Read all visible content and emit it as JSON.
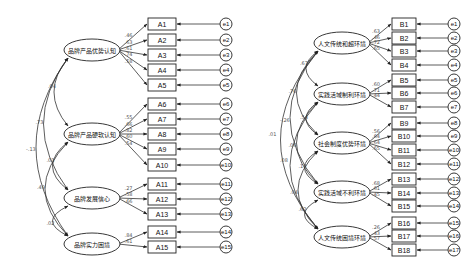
{
  "left_model": {
    "latents": [
      {
        "id": "LA1",
        "label": "品牌产品优势认知",
        "cx": 92,
        "cy": 50,
        "indicators": [
          0,
          1,
          2,
          3,
          4
        ]
      },
      {
        "id": "LA2",
        "label": "品牌产品硬软认知",
        "cx": 92,
        "cy": 134,
        "indicators": [
          5,
          6,
          7,
          8,
          9
        ]
      },
      {
        "id": "LA3",
        "label": "品牌发展信心",
        "cx": 92,
        "cy": 198,
        "indicators": [
          10,
          11,
          12
        ]
      },
      {
        "id": "LA4",
        "label": "品牌实力困境",
        "cx": 92,
        "cy": 244,
        "indicators": [
          13,
          14
        ]
      }
    ],
    "indicators": [
      {
        "label": "A1",
        "y": 24,
        "loading": ".46",
        "error": "e1"
      },
      {
        "label": "A2",
        "y": 40,
        "loading": ".63",
        "error": "e2"
      },
      {
        "label": "A3",
        "y": 55,
        "loading": ".61",
        "error": "e3"
      },
      {
        "label": "A4",
        "y": 70,
        "loading": ".74",
        "error": "e4"
      },
      {
        "label": "A5",
        "y": 85,
        "loading": ".58",
        "error": "e5"
      },
      {
        "label": "A6",
        "y": 104,
        "loading": ".55",
        "error": "e6"
      },
      {
        "label": "A7",
        "y": 119,
        "loading": ".66",
        "error": "e7"
      },
      {
        "label": "A8",
        "y": 134,
        "loading": ".82",
        "error": "e8"
      },
      {
        "label": "A9",
        "y": 149,
        "loading": ".60",
        "error": "e9"
      },
      {
        "label": "A10",
        "y": 165,
        "loading": ".54",
        "error": "e10"
      },
      {
        "label": "A11",
        "y": 184,
        "loading": ".27",
        "error": "e11"
      },
      {
        "label": "A12",
        "y": 199,
        "loading": ".58",
        "error": "e12"
      },
      {
        "label": "A13",
        "y": 214,
        "loading": ".66",
        "error": "e13"
      },
      {
        "label": "A14",
        "y": 232,
        "loading": ".84",
        "error": "e14"
      },
      {
        "label": "A15",
        "y": 247,
        "loading": ".61",
        "error": "e15"
      }
    ],
    "covariances": [
      {
        "from": 0,
        "to": 1,
        "value": ".04"
      },
      {
        "from": 0,
        "to": 2,
        "value": ".73"
      },
      {
        "from": 0,
        "to": 3,
        "value": "-.13"
      },
      {
        "from": 1,
        "to": 2,
        "value": ".03"
      },
      {
        "from": 1,
        "to": 3,
        "value": ".49"
      },
      {
        "from": 2,
        "to": 3,
        "value": ".02"
      }
    ]
  },
  "right_model": {
    "latents": [
      {
        "id": "LB1",
        "label": "人文传统和超环境",
        "cx": 342,
        "cy": 43,
        "indicators": [
          0,
          1,
          2,
          3
        ]
      },
      {
        "id": "LB2",
        "label": "实践活域制利环境",
        "cx": 342,
        "cy": 94,
        "indicators": [
          4,
          5,
          6
        ]
      },
      {
        "id": "LB3",
        "label": "社会制度优势环境",
        "cx": 342,
        "cy": 143,
        "indicators": [
          7,
          8,
          9,
          10
        ]
      },
      {
        "id": "LB4",
        "label": "实践活域不利环境",
        "cx": 342,
        "cy": 192,
        "indicators": [
          11,
          12,
          13
        ]
      },
      {
        "id": "LB5",
        "label": "人文传统困境环境",
        "cx": 342,
        "cy": 237,
        "indicators": [
          14,
          15,
          16
        ]
      }
    ],
    "indicators": [
      {
        "label": "B1",
        "y": 24,
        "loading": ".63",
        "error": "e1"
      },
      {
        "label": "B2",
        "y": 38,
        "loading": ".46",
        "error": "e2"
      },
      {
        "label": "B3",
        "y": 51,
        "loading": ".72",
        "error": "e3"
      },
      {
        "label": "B4",
        "y": 65,
        "loading": ".65",
        "error": "e4"
      },
      {
        "label": "B5",
        "y": 80,
        "loading": ".60",
        "error": "e5"
      },
      {
        "label": "B6",
        "y": 93,
        "loading": ".71",
        "error": "e6"
      },
      {
        "label": "B7",
        "y": 107,
        "loading": ".44",
        "error": "e7"
      },
      {
        "label": "B9",
        "y": 123,
        "loading": ".56",
        "error": "e8"
      },
      {
        "label": "B10",
        "y": 136,
        "loading": ".64",
        "error": "e9"
      },
      {
        "label": "B11",
        "y": 150,
        "loading": ".64",
        "error": "e10"
      },
      {
        "label": "B12",
        "y": 164,
        "loading": ".65",
        "error": "e11"
      },
      {
        "label": "B13",
        "y": 179,
        "loading": ".68",
        "error": "e12"
      },
      {
        "label": "B14",
        "y": 193,
        "loading": ".61",
        "error": "e13"
      },
      {
        "label": "B15",
        "y": 206,
        "loading": ".45",
        "error": "e14"
      },
      {
        "label": "B16",
        "y": 223,
        "loading": ".26",
        "error": "e15"
      },
      {
        "label": "B17",
        "y": 236,
        "loading": ".43",
        "error": "e16"
      },
      {
        "label": "B18",
        "y": 250,
        "loading": ".57",
        "error": "e17"
      }
    ],
    "covariances": [
      {
        "from": 0,
        "to": 1,
        "value": ".67"
      },
      {
        "from": 0,
        "to": 2,
        "value": ".76"
      },
      {
        "from": 0,
        "to": 3,
        "value": "-.26"
      },
      {
        "from": 0,
        "to": 4,
        "value": ".01"
      },
      {
        "from": 1,
        "to": 2,
        "value": ".54"
      },
      {
        "from": 1,
        "to": 3,
        "value": ".06"
      },
      {
        "from": 1,
        "to": 4,
        "value": ".08"
      },
      {
        "from": 2,
        "to": 3,
        "value": ".13"
      },
      {
        "from": 2,
        "to": 4,
        "value": ".04"
      },
      {
        "from": 3,
        "to": 4,
        "value": ".62"
      }
    ]
  }
}
